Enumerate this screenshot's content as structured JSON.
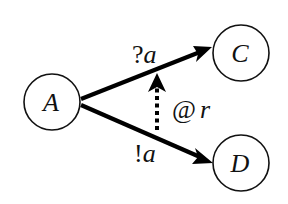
{
  "diagram": {
    "title": "",
    "nodes": [
      {
        "id": "A",
        "label": "A",
        "cx": 52,
        "cy": 102,
        "r": 28
      },
      {
        "id": "C",
        "label": "C",
        "cx": 241,
        "cy": 53,
        "r": 28
      },
      {
        "id": "D",
        "label": "D",
        "cx": 241,
        "cy": 163,
        "r": 28
      }
    ],
    "edges": [
      {
        "from": "A",
        "to": "C",
        "label_prefix": "?",
        "label_var": "a",
        "style": "solid"
      },
      {
        "from": "A",
        "to": "D",
        "label_prefix": "!",
        "label_var": "a",
        "style": "solid"
      },
      {
        "from": "A-D edge",
        "to": "A-C edge",
        "label_prefix": "@",
        "label_var": "r",
        "style": "dashed"
      }
    ],
    "colors": {
      "stroke": "#000000",
      "background": "#ffffff"
    }
  }
}
